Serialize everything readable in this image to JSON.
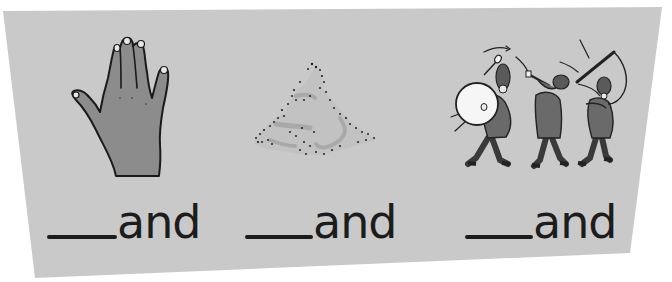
{
  "worksheet": {
    "background_color": "#c9c9c9",
    "ink_color": "#1c1c1c",
    "items": [
      {
        "picture": "hand",
        "picture_icon": "hand-icon",
        "blank": "___",
        "word_ending": "and",
        "answer_hint": "h"
      },
      {
        "picture": "sand",
        "picture_icon": "sand-pile-icon",
        "blank": "___",
        "word_ending": "and",
        "answer_hint": "s"
      },
      {
        "picture": "marching band",
        "picture_icon": "marching-band-icon",
        "blank": "___",
        "word_ending": "and",
        "answer_hint": "b"
      }
    ]
  }
}
